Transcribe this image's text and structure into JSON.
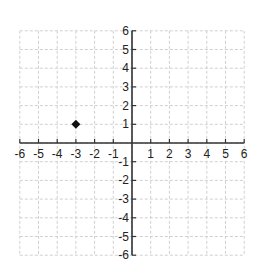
{
  "chart_data": {
    "type": "scatter",
    "title": "",
    "xlabel": "",
    "ylabel": "",
    "xlim": [
      -6,
      6
    ],
    "ylim": [
      -6,
      6
    ],
    "grid": true,
    "x_ticks": [
      "-6",
      "-5",
      "-4",
      "-3",
      "-2",
      "-1",
      "1",
      "2",
      "3",
      "4",
      "5",
      "6"
    ],
    "y_ticks": [
      "6",
      "5",
      "4",
      "3",
      "2",
      "1",
      "-1",
      "-2",
      "-3",
      "-4",
      "-5",
      "-6"
    ],
    "series": [
      {
        "name": "point",
        "points": [
          {
            "x": -3,
            "y": 1
          }
        ],
        "marker": "diamond",
        "color": "#111111"
      }
    ]
  },
  "colors": {
    "grid": "#d0d0d0",
    "axis": "#333333",
    "marker": "#111111"
  }
}
